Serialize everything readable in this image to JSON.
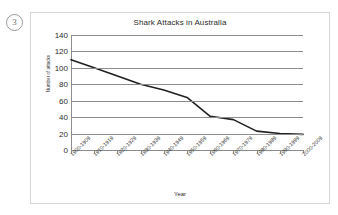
{
  "question_marker": "3",
  "chart_data": {
    "type": "line",
    "title": "Shark Attacks in Australia",
    "xlabel": "Year",
    "ylabel": "Number of attacks",
    "categories": [
      "1900-1909",
      "1910-1919",
      "1920-1929",
      "1930-1939",
      "1940-1949",
      "1950-1959",
      "1960-1969",
      "1970-1979",
      "1980-1989",
      "1990-1999",
      "2000-2009"
    ],
    "values": [
      110,
      100,
      90,
      80,
      73,
      64,
      41,
      37,
      23,
      20,
      19
    ],
    "ylim": [
      0,
      140
    ],
    "yticks": [
      0,
      20,
      40,
      60,
      80,
      100,
      120,
      140
    ],
    "grid": true,
    "legend": false,
    "line_color": "#231f20"
  }
}
